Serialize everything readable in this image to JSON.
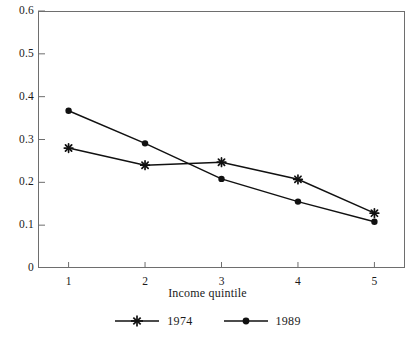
{
  "chart_data": {
    "type": "line",
    "title": "",
    "xlabel": "Income quintile",
    "ylabel": "",
    "categories": [
      "1",
      "2",
      "3",
      "4",
      "5"
    ],
    "x": [
      1,
      2,
      3,
      4,
      5
    ],
    "xlim": [
      0.6,
      5.4
    ],
    "ylim": [
      0,
      0.6
    ],
    "yticks": [
      "0",
      "0.1",
      "0.2",
      "0.3",
      "0.4",
      "0.5",
      "0.6"
    ],
    "ytick_values": [
      0,
      0.1,
      0.2,
      0.3,
      0.4,
      0.5,
      0.6
    ],
    "xticks": [
      "1",
      "2",
      "3",
      "4",
      "5"
    ],
    "grid": false,
    "legend_position": "bottom",
    "series": [
      {
        "name": "1974",
        "marker": "star-plus",
        "color": "#111111",
        "values": [
          0.28,
          0.24,
          0.247,
          0.207,
          0.128
        ]
      },
      {
        "name": "1989",
        "marker": "circle",
        "color": "#111111",
        "values": [
          0.367,
          0.291,
          0.208,
          0.155,
          0.108
        ]
      }
    ]
  },
  "axis": {
    "x_title": "Income quintile"
  },
  "legend": {
    "entries": [
      {
        "label": "1974",
        "marker": "star-plus-marker"
      },
      {
        "label": "1989",
        "marker": "circle-marker"
      }
    ]
  },
  "colors": {
    "line": "#111111",
    "frame": "#6e6e6e",
    "background": "#ffffff",
    "text": "#1a1a1a"
  }
}
